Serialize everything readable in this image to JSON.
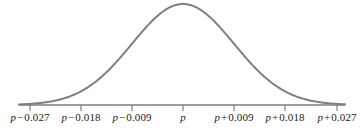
{
  "chart_data": {
    "type": "line",
    "title": "",
    "subtitle": "",
    "xlabel": "",
    "ylabel": "",
    "curve": "normal distribution density",
    "grid": false,
    "legend": null,
    "axis": {
      "x_start_px": 19,
      "x_end_px": 345,
      "baseline_y_px": 105,
      "peak_x_px": 183,
      "peak_y_px": 4,
      "sigma_px": 51
    },
    "center_value": "p",
    "sigma_value": 0.009,
    "tick_offsets": [
      -0.027,
      -0.018,
      -0.009,
      0,
      0.009,
      0.018,
      0.027
    ],
    "tick_positions_px": [
      30,
      81,
      132,
      183,
      234,
      285,
      337
    ],
    "tick_labels": [
      {
        "var": "p",
        "op": "−",
        "num": "0.027",
        "text": "p − 0.027"
      },
      {
        "var": "p",
        "op": "−",
        "num": "0.018",
        "text": "p − 0.018"
      },
      {
        "var": "p",
        "op": "−",
        "num": "0.009",
        "text": "p − 0.009"
      },
      {
        "var": "p",
        "op": "",
        "num": "",
        "text": "p"
      },
      {
        "var": "p",
        "op": "+",
        "num": "0.009",
        "text": "p + 0.009"
      },
      {
        "var": "p",
        "op": "+",
        "num": "0.018",
        "text": "p + 0.018"
      },
      {
        "var": "p",
        "op": "+",
        "num": "0.027",
        "text": "p + 0.027"
      }
    ],
    "x": [
      -3,
      -2.75,
      -2.5,
      -2.25,
      -2,
      -1.75,
      -1.5,
      -1.25,
      -1,
      -0.75,
      -0.5,
      -0.25,
      0,
      0.25,
      0.5,
      0.75,
      1,
      1.25,
      1.5,
      1.75,
      2,
      2.25,
      2.5,
      2.75,
      3
    ],
    "y": [
      0.011,
      0.023,
      0.044,
      0.079,
      0.135,
      0.216,
      0.325,
      0.458,
      0.607,
      0.754,
      0.882,
      0.969,
      1.0,
      0.969,
      0.882,
      0.754,
      0.607,
      0.458,
      0.325,
      0.216,
      0.135,
      0.079,
      0.044,
      0.023,
      0.011
    ],
    "colors": {
      "curve": "#7f7f7f",
      "axis": "#7f7f7f",
      "tick": "#7f7f7f",
      "label": "#1a1a1a",
      "background": "#ffffff"
    }
  }
}
